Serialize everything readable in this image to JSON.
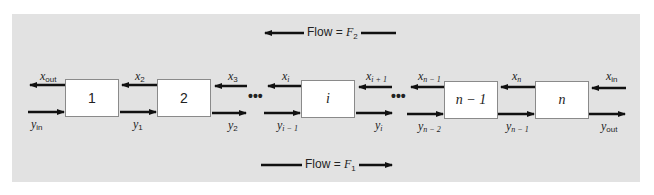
{
  "diagram": {
    "flows": {
      "top": {
        "text": "Flow = ",
        "var": "F",
        "sub": "2",
        "direction": "left"
      },
      "bottom": {
        "text": "Flow = ",
        "var": "F",
        "sub": "1",
        "direction": "right"
      }
    },
    "stages": [
      {
        "id": "1",
        "label": "1"
      },
      {
        "id": "2",
        "label": "2"
      },
      {
        "id": "i",
        "label": "i"
      },
      {
        "id": "n-1",
        "label": "n − 1"
      },
      {
        "id": "n",
        "label": "n"
      }
    ],
    "ellipsis": "•••",
    "x_stream_labels": [
      {
        "var": "x",
        "sub": "out"
      },
      {
        "var": "x",
        "sub": "2"
      },
      {
        "var": "x",
        "sub": "3"
      },
      {
        "var": "x",
        "sub": "i"
      },
      {
        "var": "x",
        "sub": "i + 1"
      },
      {
        "var": "x",
        "sub": "n − 1"
      },
      {
        "var": "x",
        "sub": "n"
      },
      {
        "var": "x",
        "sub": "in"
      }
    ],
    "y_stream_labels": [
      {
        "var": "y",
        "sub": "in"
      },
      {
        "var": "y",
        "sub": "1"
      },
      {
        "var": "y",
        "sub": "2"
      },
      {
        "var": "y",
        "sub": "i − 1"
      },
      {
        "var": "y",
        "sub": "i"
      },
      {
        "var": "y",
        "sub": "n − 2"
      },
      {
        "var": "y",
        "sub": "n − 1"
      },
      {
        "var": "y",
        "sub": "out"
      }
    ],
    "colors": {
      "panel": "#e2e2e2",
      "box_fill": "#ffffff",
      "arrow": "#111111",
      "text": "#222222"
    }
  }
}
